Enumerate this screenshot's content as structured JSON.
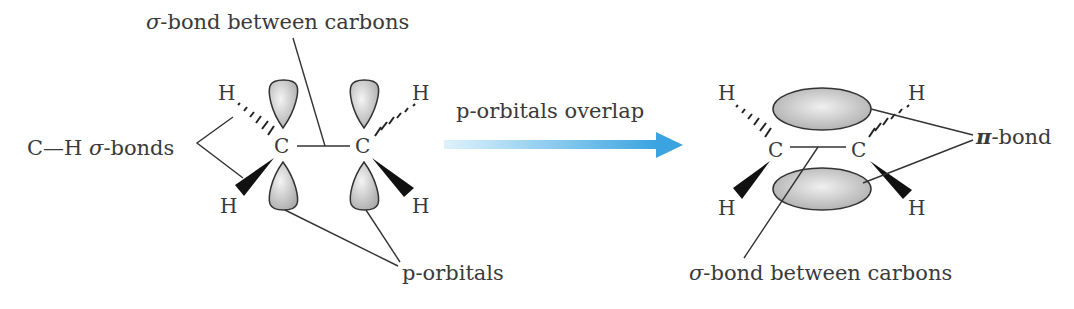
{
  "diagram": {
    "left_panel": {
      "top_label": "σ-bond between carbons",
      "ch_label_prefix": "C—H ",
      "ch_label_greek": "σ",
      "ch_label_suffix": "-bonds",
      "bottom_label": "p-orbitals",
      "atoms": {
        "c1": "C",
        "c2": "C",
        "h_tl": "H",
        "h_bl": "H",
        "h_tr": "H",
        "h_br": "H"
      }
    },
    "arrow": {
      "label": "p-orbitals overlap",
      "color_start": "#d8effa",
      "color_end": "#3aa3e0"
    },
    "right_panel": {
      "pi_label_greek": "π",
      "pi_label_suffix": "-bond",
      "bottom_label_greek": "σ",
      "bottom_label_suffix": "-bond between carbons",
      "atoms": {
        "c1": "C",
        "c2": "C",
        "h_tl": "H",
        "h_bl": "H",
        "h_tr": "H",
        "h_br": "H"
      }
    }
  }
}
